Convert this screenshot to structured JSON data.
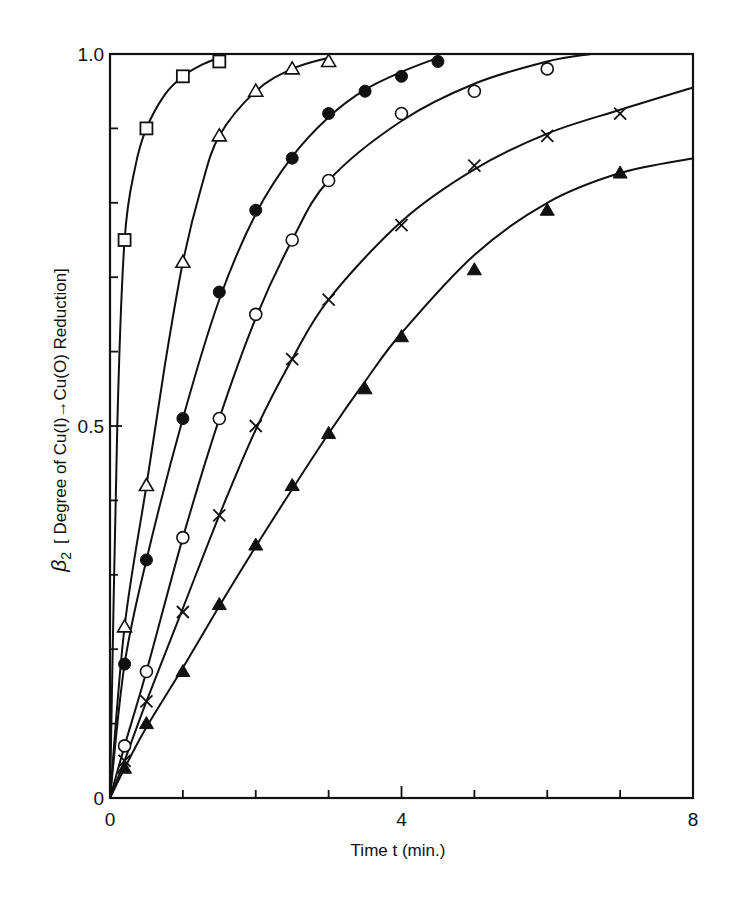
{
  "chart_data": {
    "type": "scatter",
    "title": "",
    "xlabel": "Time t (min.)",
    "ylabel_symbol": "β",
    "ylabel_subscript": "2",
    "ylabel_text": "[ Degree of Cu(I)→Cu(O) Reduction]",
    "xlim": [
      0,
      8
    ],
    "ylim": [
      0,
      1.0
    ],
    "x_ticks": [
      0,
      4,
      8
    ],
    "x_tick_labels": [
      "0",
      "4",
      "8"
    ],
    "x_minor_step": 1,
    "y_ticks": [
      0,
      0.5,
      1.0
    ],
    "y_tick_labels": [
      "0",
      "0.5",
      "1.0"
    ],
    "y_minor_step": 0.1,
    "grid": false,
    "legend": null,
    "series": [
      {
        "name": "open squares",
        "marker": "square-open",
        "x": [
          0.2,
          0.5,
          1.0,
          1.5
        ],
        "y": [
          0.75,
          0.9,
          0.97,
          0.99
        ],
        "curve_x": [
          0,
          0.1,
          0.2,
          0.35,
          0.5,
          0.75,
          1.0,
          1.25,
          1.5
        ],
        "curve_y": [
          0,
          0.5,
          0.75,
          0.85,
          0.9,
          0.945,
          0.97,
          0.985,
          0.995
        ]
      },
      {
        "name": "open triangles",
        "marker": "triangle-open",
        "x": [
          0.2,
          0.5,
          1.0,
          1.5,
          2.0,
          2.5,
          3.0
        ],
        "y": [
          0.23,
          0.42,
          0.72,
          0.89,
          0.95,
          0.98,
          0.99
        ],
        "curve_x": [
          0,
          0.2,
          0.5,
          0.75,
          1.0,
          1.25,
          1.5,
          2.0,
          2.5,
          3.0
        ],
        "curve_y": [
          0,
          0.23,
          0.42,
          0.58,
          0.72,
          0.82,
          0.89,
          0.95,
          0.98,
          0.995
        ]
      },
      {
        "name": "filled circles",
        "marker": "circle-filled",
        "x": [
          0.2,
          0.5,
          1.0,
          1.5,
          2.0,
          2.5,
          3.0,
          3.5,
          4.0,
          4.5
        ],
        "y": [
          0.18,
          0.32,
          0.51,
          0.68,
          0.79,
          0.86,
          0.92,
          0.95,
          0.97,
          0.99
        ],
        "curve_x": [
          0,
          0.2,
          0.5,
          1.0,
          1.5,
          2.0,
          2.5,
          3.0,
          3.5,
          4.0,
          4.5
        ],
        "curve_y": [
          0,
          0.18,
          0.32,
          0.51,
          0.67,
          0.785,
          0.862,
          0.915,
          0.952,
          0.976,
          0.995
        ]
      },
      {
        "name": "open circles",
        "marker": "circle-open",
        "x": [
          0.2,
          0.5,
          1.0,
          1.5,
          2.0,
          2.5,
          3.0,
          4.0,
          5.0,
          6.0
        ],
        "y": [
          0.07,
          0.17,
          0.35,
          0.51,
          0.65,
          0.75,
          0.83,
          0.92,
          0.95,
          0.98
        ],
        "curve_x": [
          0,
          0.2,
          0.5,
          1.0,
          1.5,
          2.0,
          2.5,
          3.0,
          4.0,
          5.0,
          6.0,
          6.6
        ],
        "curve_y": [
          0,
          0.07,
          0.17,
          0.35,
          0.51,
          0.645,
          0.75,
          0.83,
          0.91,
          0.96,
          0.99,
          1.0
        ]
      },
      {
        "name": "crosses",
        "marker": "cross",
        "x": [
          0.2,
          0.5,
          1.0,
          1.5,
          2.0,
          2.5,
          3.0,
          4.0,
          5.0,
          6.0,
          7.0
        ],
        "y": [
          0.05,
          0.13,
          0.25,
          0.38,
          0.5,
          0.59,
          0.67,
          0.77,
          0.85,
          0.89,
          0.92
        ],
        "curve_x": [
          0,
          0.2,
          0.5,
          1.0,
          1.5,
          2.0,
          2.5,
          3.0,
          4.0,
          5.0,
          6.0,
          7.0,
          8.0
        ],
        "curve_y": [
          0,
          0.05,
          0.13,
          0.255,
          0.38,
          0.495,
          0.59,
          0.67,
          0.775,
          0.845,
          0.893,
          0.925,
          0.955
        ]
      },
      {
        "name": "filled triangles",
        "marker": "triangle-filled",
        "x": [
          0.2,
          0.5,
          1.0,
          1.5,
          2.0,
          2.5,
          3.0,
          3.5,
          4.0,
          5.0,
          6.0,
          7.0
        ],
        "y": [
          0.04,
          0.1,
          0.17,
          0.26,
          0.34,
          0.42,
          0.49,
          0.55,
          0.62,
          0.71,
          0.79,
          0.84
        ],
        "curve_x": [
          0,
          0.2,
          0.5,
          1.0,
          1.5,
          2.0,
          2.5,
          3.0,
          3.5,
          4.0,
          5.0,
          6.0,
          7.0,
          8.0
        ],
        "curve_y": [
          0,
          0.04,
          0.095,
          0.175,
          0.258,
          0.338,
          0.415,
          0.49,
          0.56,
          0.625,
          0.73,
          0.8,
          0.84,
          0.86
        ]
      }
    ]
  }
}
